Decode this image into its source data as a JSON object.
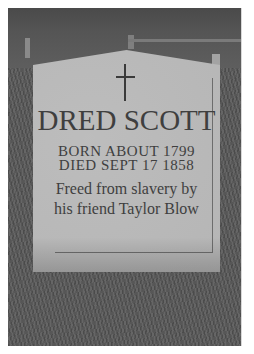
{
  "image": {
    "subject": "headstone",
    "style": "grayscale photograph",
    "colors": {
      "page_background": "#ffffff",
      "grass": "#575757",
      "stone": "#b9b9b9",
      "engraving": "#3f3f3f"
    }
  },
  "headstone": {
    "symbol": "cross",
    "name": "DRED SCOTT",
    "born": "BORN ABOUT 1799",
    "died": "DIED SEPT 17 1858",
    "epitaph": [
      "Freed from slavery by",
      "his friend Taylor Blow"
    ]
  }
}
